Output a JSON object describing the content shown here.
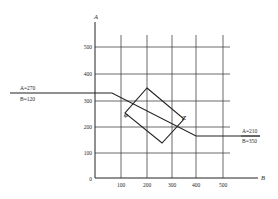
{
  "diagram": {
    "axes": {
      "x_label": "B",
      "y_label": "A",
      "x_ticks": [
        "100",
        "200",
        "300",
        "400",
        "500"
      ],
      "y_ticks": [
        "0",
        "100",
        "200",
        "300",
        "400",
        "500"
      ]
    },
    "annotations": {
      "left_A": "A=270",
      "left_B": "B=120",
      "right_A": "A=210",
      "right_B": "B=350",
      "point_phi": "φ",
      "point_z": "Z"
    },
    "colors": {
      "line": "#2a2a2a",
      "grid": "#444444",
      "background": "#ffffff"
    }
  }
}
